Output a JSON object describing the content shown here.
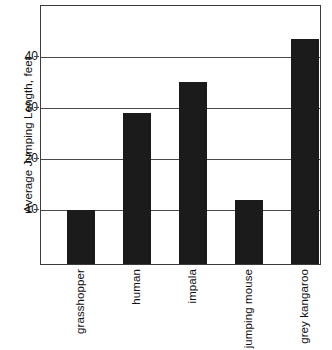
{
  "chart_data": {
    "type": "bar",
    "title": "",
    "subtitle": "",
    "xlabel": "",
    "ylabel": "Average Jumping Length, feet",
    "categories": [
      "grasshopper",
      "human",
      "impala",
      "jumping mouse",
      "grey kangaroo"
    ],
    "values": [
      10,
      29,
      35,
      12,
      43.5
    ],
    "ylim": [
      -0.6,
      50
    ],
    "yticks": [
      10,
      20,
      30,
      40
    ],
    "ytick_labels": [
      "10",
      "20",
      "30",
      "40"
    ],
    "grid": "horizontal",
    "legend": "none",
    "bar_color": "#1b1b1b",
    "axis_color": "#3b3b3b",
    "background": "#ffffff",
    "annotations": []
  }
}
